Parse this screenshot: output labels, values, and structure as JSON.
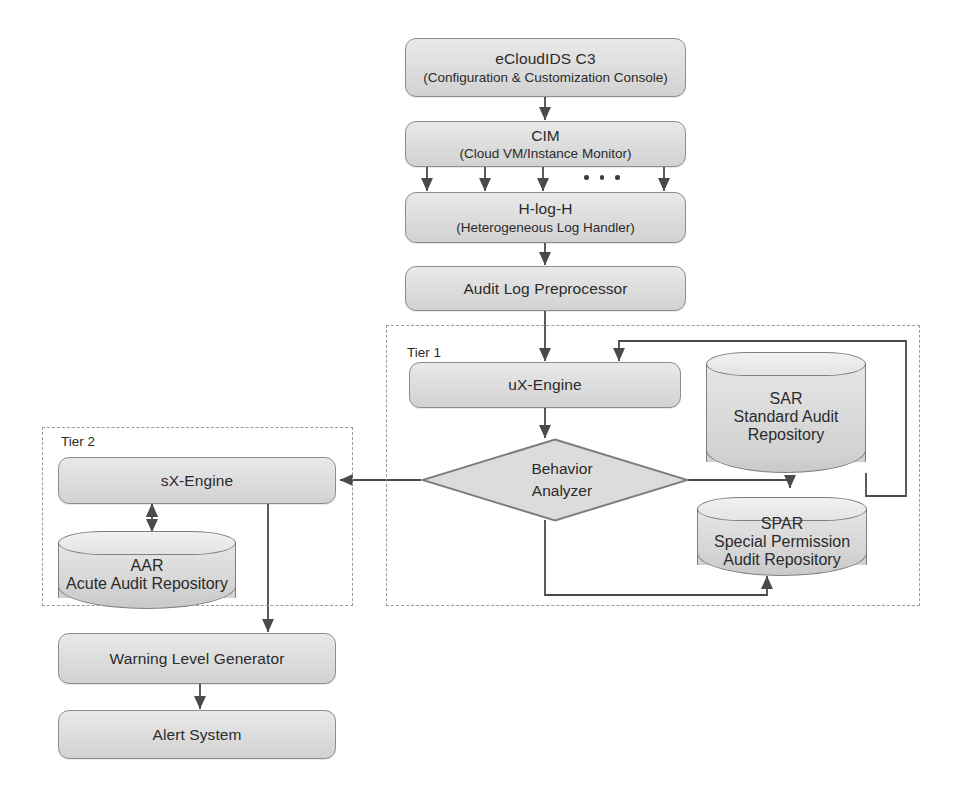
{
  "diagram": {
    "colors": {
      "node_fill": "#dcdcdc",
      "node_stroke": "#8d8d8d",
      "edge": "#4a4a4a",
      "tier_border": "#9a9a9a",
      "text": "#2b2b2b",
      "background": "#ffffff"
    },
    "nodes": {
      "console": {
        "title": "eCloudIDS C3",
        "subtitle": "(Configuration & Customization Console)"
      },
      "cim": {
        "title": "CIM",
        "subtitle": "(Cloud VM/Instance Monitor)"
      },
      "hlogh": {
        "title": "H-log-H",
        "subtitle": "(Heterogeneous Log Handler)"
      },
      "preprocessor": {
        "title": "Audit Log Preprocessor"
      },
      "ux_engine": {
        "title": "uX-Engine"
      },
      "behavior_analyzer": {
        "line1": "Behavior",
        "line2": "Analyzer"
      },
      "sar": {
        "title": "SAR",
        "subtitle": "Standard Audit Repository"
      },
      "spar": {
        "title": "SPAR",
        "subtitle_line1": "Special Permission",
        "subtitle_line2": "Audit Repository"
      },
      "sx_engine": {
        "title": "sX-Engine"
      },
      "aar": {
        "title": "AAR",
        "subtitle": "Acute Audit Repository"
      },
      "warning_generator": {
        "title": "Warning Level Generator"
      },
      "alert_system": {
        "title": "Alert System"
      }
    },
    "groups": {
      "tier1": {
        "label": "Tier 1"
      },
      "tier2": {
        "label": "Tier 2"
      }
    },
    "ellipsis": {
      "symbol": "• • •",
      "meaning": "additional-monitored-instances"
    },
    "edges": [
      {
        "from": "console",
        "to": "cim",
        "type": "arrow"
      },
      {
        "from": "cim",
        "to": "hlogh",
        "type": "arrow-fanout",
        "count": 4
      },
      {
        "from": "hlogh",
        "to": "preprocessor",
        "type": "arrow"
      },
      {
        "from": "preprocessor",
        "to": "ux_engine",
        "type": "arrow"
      },
      {
        "from": "ux_engine",
        "to": "behavior_analyzer",
        "type": "arrow"
      },
      {
        "from": "behavior_analyzer",
        "to": "sx_engine",
        "type": "arrow"
      },
      {
        "from": "behavior_analyzer",
        "to": "sar",
        "type": "arrow"
      },
      {
        "from": "behavior_analyzer",
        "to": "spar",
        "type": "arrow"
      },
      {
        "from": "sar",
        "to": "ux_engine",
        "type": "feedback-loop"
      },
      {
        "from": "sx_engine",
        "to": "aar",
        "type": "bidirectional-arrow"
      },
      {
        "from": "sx_engine",
        "to": "warning_generator",
        "type": "arrow"
      },
      {
        "from": "warning_generator",
        "to": "alert_system",
        "type": "arrow"
      }
    ]
  }
}
